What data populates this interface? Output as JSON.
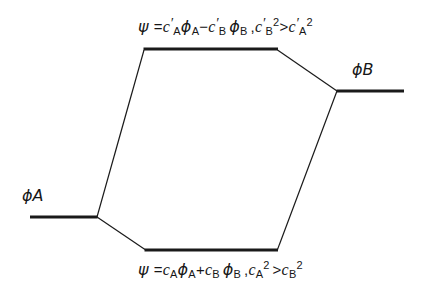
{
  "figure": {
    "type": "molecular-orbital-energy-level-diagram",
    "background_color": "#ffffff",
    "line_color": "#1a1a1a"
  },
  "labels": {
    "phi_a": "ϕA",
    "phi_b": "ϕB"
  },
  "equations": {
    "antibonding": {
      "psi": "ψ",
      "equals": "=",
      "c_a": "c",
      "c_a_prime": "′",
      "c_a_sub": "A",
      "phi_a": "ϕ",
      "phi_a_sub": "A",
      "operator": "−",
      "c_b": "c",
      "c_b_prime": "′",
      "c_b_sub": "B",
      "phi_b": "ϕ",
      "phi_b_sub": "B",
      "comma": ",",
      "ineq_left_c": "c",
      "ineq_left_prime": "′",
      "ineq_left_sub": "B",
      "ineq_left_sup": "2",
      "ineq_sign": ">",
      "ineq_right_c": "c",
      "ineq_right_prime": "′",
      "ineq_right_sub": "A",
      "ineq_right_sup": "2",
      "plain_text": "ψ = c′A ϕA − c′B ϕB , c′B² > c′A²"
    },
    "bonding": {
      "psi": "ψ",
      "equals": "=",
      "c_a": "c",
      "c_a_sub": "A",
      "phi_a": "ϕ",
      "phi_a_sub": "A",
      "operator": "+",
      "c_b": "c",
      "c_b_sub": "B",
      "phi_b": "ϕ",
      "phi_b_sub": "B",
      "comma": ",",
      "ineq_left_c": "c",
      "ineq_left_sub": "A",
      "ineq_left_sup": "2",
      "ineq_sign": ">",
      "ineq_right_c": "c",
      "ineq_right_sub": "B",
      "ineq_right_sup": "2",
      "plain_text": "ψ = cA ϕA + cB ϕB , cA² > cB²"
    }
  },
  "geometry": {
    "levels": [
      {
        "name": "antibonding-level",
        "x1": 144,
        "x2": 278,
        "y": 49,
        "thickness": 3
      },
      {
        "name": "phi-a-level",
        "x1": 30,
        "x2": 97,
        "y": 217,
        "thickness": 3
      },
      {
        "name": "phi-b-level",
        "x1": 337,
        "x2": 404,
        "y": 91,
        "thickness": 3
      },
      {
        "name": "bonding-level",
        "x1": 145,
        "x2": 278,
        "y": 250,
        "thickness": 3
      }
    ],
    "connectors": [
      {
        "name": "phi-a-to-antibonding",
        "x1": 97,
        "y1": 217,
        "x2": 144,
        "y2": 49
      },
      {
        "name": "phi-a-to-bonding",
        "x1": 97,
        "y1": 217,
        "x2": 145,
        "y2": 250
      },
      {
        "name": "antibonding-to-phi-b",
        "x1": 278,
        "y1": 49,
        "x2": 337,
        "y2": 91
      },
      {
        "name": "bonding-to-phi-b",
        "x1": 278,
        "y1": 250,
        "x2": 337,
        "y2": 91
      }
    ]
  }
}
